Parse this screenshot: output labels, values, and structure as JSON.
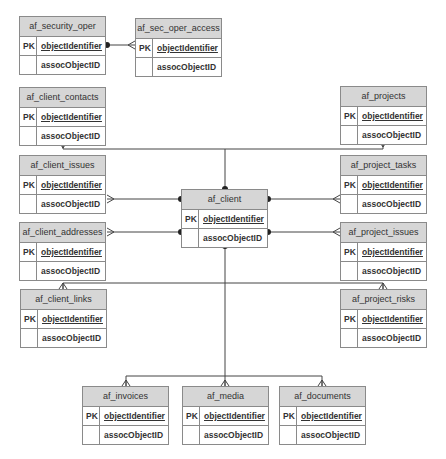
{
  "diagram": {
    "type": "entity-relationship",
    "colors": {
      "header_bg": "#d6d6d6",
      "border": "#8a8a8a",
      "line": "#444444",
      "text": "#333333"
    },
    "entities": {
      "security_oper": {
        "name": "af_security_oper",
        "pk_label": "PK",
        "pk_field": "objectIdentifier",
        "field2": "assocObjectID"
      },
      "sec_oper_access": {
        "name": "af_sec_oper_access",
        "pk_label": "PK",
        "pk_field": "objectIdentifier",
        "field2": "assocObjectID"
      },
      "client_contacts": {
        "name": "af_client_contacts",
        "pk_label": "PK",
        "pk_field": "objectIdentifier",
        "field2": "assocObjectID"
      },
      "projects": {
        "name": "af_projects",
        "pk_label": "PK",
        "pk_field": "objectIdentifier",
        "field2": "assocObjectID"
      },
      "client_issues": {
        "name": "af_client_issues",
        "pk_label": "PK",
        "pk_field": "objectIdentifier",
        "field2": "assocObjectID"
      },
      "project_tasks": {
        "name": "af_project_tasks",
        "pk_label": "PK",
        "pk_field": "objectIdentifier",
        "field2": "assocObjectID"
      },
      "client": {
        "name": "af_client",
        "pk_label": "PK",
        "pk_field": "objectIdentifier",
        "field2": "assocObjectID"
      },
      "client_addresses": {
        "name": "af_client_addresses",
        "pk_label": "PK",
        "pk_field": "objectIdentifier",
        "field2": "assocObjectID"
      },
      "project_issues": {
        "name": "af_project_issues",
        "pk_label": "PK",
        "pk_field": "objectIdentifier",
        "field2": "assocObjectID"
      },
      "client_links": {
        "name": "af_client_links",
        "pk_label": "PK",
        "pk_field": "objectIdentifier",
        "field2": "assocObjectID"
      },
      "project_risks": {
        "name": "af_project_risks",
        "pk_label": "PK",
        "pk_field": "objectIdentifier",
        "field2": "assocObjectID"
      },
      "invoices": {
        "name": "af_invoices",
        "pk_label": "PK",
        "pk_field": "objectIdentifier",
        "field2": "assocObjectID"
      },
      "media": {
        "name": "af_media",
        "pk_label": "PK",
        "pk_field": "objectIdentifier",
        "field2": "assocObjectID"
      },
      "documents": {
        "name": "af_documents",
        "pk_label": "PK",
        "pk_field": "objectIdentifier",
        "field2": "assocObjectID"
      }
    },
    "relationships": [
      {
        "from": "af_security_oper",
        "to": "af_sec_oper_access",
        "cardinality": "one-to-many"
      },
      {
        "from": "af_client",
        "to": "af_client_contacts",
        "cardinality": "one-to-many"
      },
      {
        "from": "af_client",
        "to": "af_projects",
        "cardinality": "one-to-many"
      },
      {
        "from": "af_client",
        "to": "af_client_issues",
        "cardinality": "one-to-many"
      },
      {
        "from": "af_client",
        "to": "af_project_tasks",
        "cardinality": "one-to-many"
      },
      {
        "from": "af_client",
        "to": "af_client_addresses",
        "cardinality": "one-to-many"
      },
      {
        "from": "af_client",
        "to": "af_project_issues",
        "cardinality": "one-to-many"
      },
      {
        "from": "af_client",
        "to": "af_client_links",
        "cardinality": "one-to-many"
      },
      {
        "from": "af_client",
        "to": "af_project_risks",
        "cardinality": "one-to-many"
      },
      {
        "from": "af_client",
        "to": "af_invoices",
        "cardinality": "one-to-many"
      },
      {
        "from": "af_client",
        "to": "af_media",
        "cardinality": "one-to-many"
      },
      {
        "from": "af_client",
        "to": "af_documents",
        "cardinality": "one-to-many"
      }
    ]
  }
}
